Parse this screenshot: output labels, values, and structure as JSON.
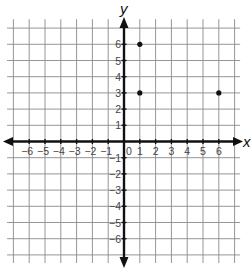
{
  "chart_data": {
    "type": "scatter",
    "title": "",
    "xlabel": "x",
    "ylabel": "y",
    "xlim": [
      -7,
      7
    ],
    "ylim": [
      -7,
      7
    ],
    "grid": true,
    "x_tick_labels": [
      "−6",
      "−5",
      "−4",
      "−3",
      "−2",
      "−1",
      "0",
      "1",
      "2",
      "3",
      "4",
      "5",
      "6"
    ],
    "y_tick_labels": [
      "6",
      "5",
      "4",
      "3",
      "2",
      "1",
      "−1",
      "−2",
      "−3",
      "−4",
      "−5",
      "−6"
    ],
    "x_ticks": [
      -6,
      -5,
      -4,
      -3,
      -2,
      -1,
      0,
      1,
      2,
      3,
      4,
      5,
      6
    ],
    "y_ticks": [
      6,
      5,
      4,
      3,
      2,
      1,
      -1,
      -2,
      -3,
      -4,
      -5,
      -6
    ],
    "points": [
      {
        "x": 1,
        "y": 6
      },
      {
        "x": 1,
        "y": 3
      },
      {
        "x": 6,
        "y": 3
      }
    ]
  },
  "colors": {
    "grid": "#8a8a8a",
    "axis": "#111111",
    "point": "#111111",
    "label": "#444444"
  }
}
